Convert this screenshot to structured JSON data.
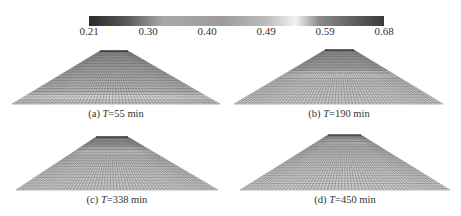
{
  "chart_data": {
    "type": "heatmap",
    "title": "",
    "colorbar": {
      "min": 0.21,
      "max": 0.68,
      "ticks": [
        "0.21",
        "0.30",
        "0.40",
        "0.49",
        "0.59",
        "0.68"
      ],
      "stops": [
        {
          "pos": 0.0,
          "color": "#2a2a2a"
        },
        {
          "pos": 0.12,
          "color": "#555555"
        },
        {
          "pos": 0.25,
          "color": "#a8a8a8"
        },
        {
          "pos": 0.45,
          "color": "#9a9a9a"
        },
        {
          "pos": 0.6,
          "color": "#b8b8b8"
        },
        {
          "pos": 0.7,
          "color": "#f2f2f2"
        },
        {
          "pos": 0.78,
          "color": "#8a8a8a"
        },
        {
          "pos": 1.0,
          "color": "#3a3a3a"
        }
      ]
    },
    "panels": [
      {
        "id": "a",
        "label": "(a)",
        "var": "T",
        "value": "=55 min",
        "wet_front": 0.85
      },
      {
        "id": "b",
        "label": "(b)",
        "var": "T",
        "value": "=190 min",
        "wet_front": 0.45
      },
      {
        "id": "c",
        "label": "(c)",
        "var": "T",
        "value": "=338 min",
        "wet_front": 0.25
      },
      {
        "id": "d",
        "label": "(d)",
        "var": "T",
        "value": "=450 min",
        "wet_front": 0.12
      }
    ]
  },
  "colorbar_ticks": [
    "0.21",
    "0.30",
    "0.40",
    "0.49",
    "0.59",
    "0.68"
  ],
  "captions": {
    "a": {
      "prefix": "(a) ",
      "var": "T",
      "suffix": "=55 min"
    },
    "b": {
      "prefix": "(b) ",
      "var": "T",
      "suffix": "=190 min"
    },
    "c": {
      "prefix": "(c) ",
      "var": "T",
      "suffix": "=338 min"
    },
    "d": {
      "prefix": "(d) ",
      "var": "T",
      "suffix": "=450 min"
    }
  }
}
